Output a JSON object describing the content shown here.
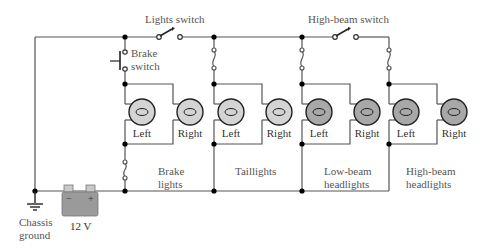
{
  "labels": {
    "lights_switch": "Lights switch",
    "high_beam_switch": "High-beam switch",
    "brake_switch_line1": "Brake",
    "brake_switch_line2": "switch",
    "chassis_ground_line1": "Chassis",
    "chassis_ground_line2": "ground",
    "battery_voltage": "12 V",
    "battery_minus": "−",
    "battery_plus": "+"
  },
  "groups": [
    {
      "id": "brake",
      "name_line1": "Brake",
      "name_line2": "lights",
      "lamp_left": "Left",
      "lamp_right": "Right",
      "lamp_shade": "light"
    },
    {
      "id": "tail",
      "name_line1": "Taillights",
      "name_line2": "",
      "lamp_left": "Left",
      "lamp_right": "Right",
      "lamp_shade": "light"
    },
    {
      "id": "lowbeam",
      "name_line1": "Low-beam",
      "name_line2": "headlights",
      "lamp_left": "Left",
      "lamp_right": "Right",
      "lamp_shade": "dark"
    },
    {
      "id": "highbeam",
      "name_line1": "High-beam",
      "name_line2": "headlights",
      "lamp_left": "Left",
      "lamp_right": "Right",
      "lamp_shade": "dark"
    }
  ],
  "colors": {
    "wire": "#555555",
    "node": "#000000",
    "lamp_light": "#d4d4d4",
    "lamp_dark": "#a8a8a8",
    "battery": "#9a9a9a",
    "text": "#555555"
  }
}
